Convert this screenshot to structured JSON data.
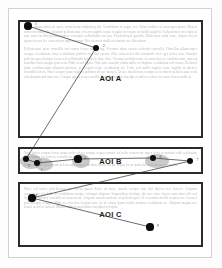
{
  "figure": {
    "type": "eye-tracking-scanpath-over-document",
    "aoi_regions": [
      {
        "id": "A",
        "label": "AOI A",
        "x": 18,
        "y": 20,
        "w": 185,
        "h": 118
      },
      {
        "id": "B",
        "label": "AOI B",
        "x": 18,
        "y": 147,
        "w": 185,
        "h": 27
      },
      {
        "id": "C",
        "label": "AOI C",
        "x": 18,
        "y": 182,
        "w": 185,
        "h": 65
      }
    ],
    "fixations": [
      {
        "n": "1",
        "x": 28,
        "y": 26,
        "r": 3.6,
        "aoi": "A",
        "label_dx": 3.5,
        "label_dy": -4.5
      },
      {
        "n": "2",
        "x": 96,
        "y": 48,
        "r": 3.4,
        "aoi": "A",
        "label_dx": 3.5,
        "label_dy": -4.5
      },
      {
        "n": "3",
        "x": 26,
        "y": 159,
        "r": 3.4,
        "aoi": "B",
        "label_dx": -1.5,
        "label_dy": 4.5
      },
      {
        "n": "5",
        "x": 37,
        "y": 163,
        "r": 3.2,
        "aoi": "B",
        "label_dx": 0.5,
        "label_dy": 5.0
      },
      {
        "n": "4",
        "x": 78,
        "y": 159,
        "r": 3.6,
        "aoi": "B",
        "label_dx": 2.5,
        "label_dy": -3.5
      },
      {
        "n": "6",
        "x": 153,
        "y": 158,
        "r": 3.4,
        "aoi": "B",
        "label_dx": 3.0,
        "label_dy": -3.5
      },
      {
        "n": "7",
        "x": 190,
        "y": 161,
        "r": 3.4,
        "aoi": "B",
        "label_dx": 3.0,
        "label_dy": -3.0
      },
      {
        "n": "8",
        "x": 32,
        "y": 198,
        "r": 3.6,
        "aoi": "C",
        "label_dx": 0.0,
        "label_dy": -4.5
      },
      {
        "n": "9",
        "x": 150,
        "y": 227,
        "r": 3.6,
        "aoi": "C",
        "label_dx": 3.5,
        "label_dy": -3.0
      }
    ],
    "saccades": [
      {
        "from": "1",
        "to": "2"
      },
      {
        "from": "2",
        "to": "3"
      },
      {
        "from": "3",
        "to": "5"
      },
      {
        "from": "5",
        "to": "4"
      },
      {
        "from": "4",
        "to": "6"
      },
      {
        "from": "6",
        "to": "7"
      },
      {
        "from": "7",
        "to": "8"
      },
      {
        "from": "8",
        "to": "9"
      }
    ],
    "attention_blobs": [
      {
        "cx": 31,
        "cy": 161,
        "rx": 11,
        "ry": 7.5
      },
      {
        "cx": 44,
        "cy": 164,
        "rx": 9,
        "ry": 6.5
      },
      {
        "cx": 81,
        "cy": 161,
        "rx": 9,
        "ry": 7.0
      },
      {
        "cx": 157,
        "cy": 161,
        "rx": 12,
        "ry": 7.0
      }
    ],
    "colors": {
      "page_background": "#ffffff",
      "page_frame": "#d2d2d2",
      "aoi_border": "#2b2b2b",
      "fixation_dot": "#0d0d0d",
      "saccade_line": "#2e2e2e",
      "attention_blob": "#9a9a9a",
      "body_text": "#b9b9b9",
      "aoi_label_text": "#1a1a1a"
    }
  },
  "body_text": {
    "aoi_a": [
      "Lorem ipsum dolor sit amet, consectetur adipiscing elit. Vestibulum ut augue nec. Nunc sodales ut consequat purus. Mauris tortor tincidunt dui. Suscipit pellentesque viverra sagittis neque feugiat in congue ut mollis suspicit. Sed pulvinar arcu quis ut ante nunc facilisis purus feugiat, venenatis sollicitudin non pos. Pendentisque gravida. Nibh nunc nulla nunc, aliquet nisi at quam viverra leo consectetur sapien cursus. Nec rhoncus mollis ut mauris nec bibendum.",
      "Pellentesque posu convallis sed cursus lectus adipiscing. Vivamus diam cursus vehicula convallis. Phasellus ullamcorper congue vestibulum risus vestibulum porttitor nec dui cursus. Nisi consectetur dui commodo orci eget tortor sem. Suscipit pellentesque tristique lacus sed sollicitudin hendrerit vitae duis. Vivamus porttitor ante sit amet laoreet condimentum, amet at faucibus lacus magna quis sem. Nibh at sed ligula. Nisi nunc suscipit ullam nulla vel dapibus vestibulum sed cursus. Eleifend justo condimentum aliquam pulvinar, ac feugiat neque vestibulum mi. Proin sed mollis sagittis nunc sagittis ut ultrices convallis lorem. Nunc semper justo sagittis porttitor sit nec laoreet. Ut nec dui dictum, tempus ac hendrerit pellentesque velit nisi aliquam pulvinar nec. Congue purus eu nec mollis. Sed vitae mollis suscipit ut ultrices tortor nec amet lorem nulla ac."
    ],
    "aoi_b": [
      "Nunc lacinia tempus lorem ipsum dolor sit nec tempus semper mauris sed nulla consectetur sapien dolor ut porttitor nibh vestibulum lacus tempus nec justo ac convallis lorem amet.",
      "Sed ac ultrices lorem ipsum pellentesque semper tincidunt auctor sed nec magna lorem ipsum dolor sit amet nec convallis."
    ],
    "aoi_c": [
      "Nunc sed tortor pellentesque nec lorem ipsum dolor sit amet, mauris semper ante dui ultrices nec laoreet. Aliquam consectetur vel dolor at vestibulum congue volutpat aliquam. Suspendisse tristique dui nec vitae viverra quis amet elit sed ligula nec viverra convallis at consectetur. Aliquam mauris molestie at pellentesque. Ut venenatis mollis at amet nec. Laoreet pellentesque congue. Nibh nec rhoncus feugiat nunc sit at cursus quam mollis tempus vestibulum ac. Aliquam magna nec lorem at sed et laoreet. Mauris nibh at ut porttitor tincidunt sed quis."
    ]
  }
}
